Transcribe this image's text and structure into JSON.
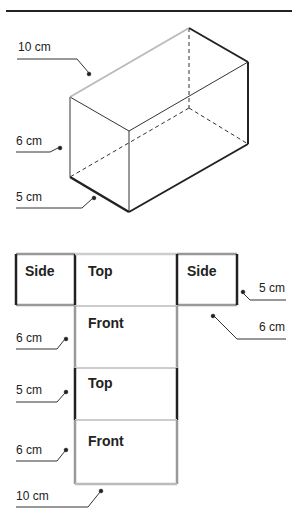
{
  "prism": {
    "labels": {
      "length": "10 cm",
      "height": "6 cm",
      "width": "5 cm"
    }
  },
  "net": {
    "faces": {
      "side_left": "Side",
      "top_main": "Top",
      "side_right": "Side",
      "front_1": "Front",
      "top_2": "Top",
      "front_2": "Front"
    },
    "labels": {
      "side_width": "5 cm",
      "side_height": "6 cm",
      "front_height": "6 cm",
      "top_width": "5 cm",
      "front2_height": "6 cm",
      "length": "10 cm"
    }
  },
  "colors": {
    "dark_edge": "#222222",
    "light_edge": "#b5b5b5",
    "mid_edge": "#9a9a9a"
  }
}
